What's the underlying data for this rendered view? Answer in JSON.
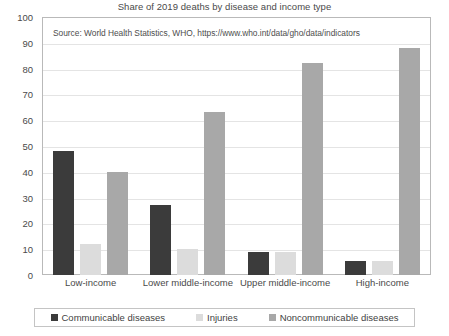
{
  "chart_data": {
    "type": "bar",
    "title": "Share of 2019 deaths by disease and income type",
    "xlabel": "",
    "ylabel": "",
    "ylim": [
      0,
      100
    ],
    "ytick_step": 10,
    "grid": true,
    "legend_position": "bottom",
    "annotation": "Source: World Health Statistics, WHO, https://www.who.int/data/gho/data/indicators",
    "categories": [
      "Low-income",
      "Lower middle-income",
      "Upper middle-income",
      "High-income"
    ],
    "yticks": [
      "0",
      "10",
      "20",
      "30",
      "40",
      "50",
      "60",
      "70",
      "80",
      "90",
      "100"
    ],
    "series": [
      {
        "name": "Communicable diseases",
        "color": "#3b3b3b",
        "values": [
          48,
          27,
          9,
          5.5
        ]
      },
      {
        "name": "Injuries",
        "color": "#dcdcdc",
        "values": [
          12,
          10,
          9,
          5.5
        ]
      },
      {
        "name": "Noncommunicable diseases",
        "color": "#a8a8a8",
        "values": [
          40,
          63,
          82,
          88
        ]
      }
    ]
  }
}
